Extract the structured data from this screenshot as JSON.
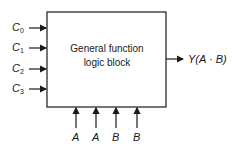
{
  "diagram": {
    "block": {
      "line1": "General function",
      "line2": "logic block"
    },
    "inputs_left": [
      {
        "base": "C",
        "sub": "0"
      },
      {
        "base": "C",
        "sub": "1"
      },
      {
        "base": "C",
        "sub": "2"
      },
      {
        "base": "C",
        "sub": "3"
      }
    ],
    "inputs_bottom": [
      "A",
      "A",
      "B",
      "B"
    ],
    "output": "Y(A · B)",
    "colors": {
      "stroke": "#1a1a1a",
      "background": "#ffffff"
    }
  }
}
